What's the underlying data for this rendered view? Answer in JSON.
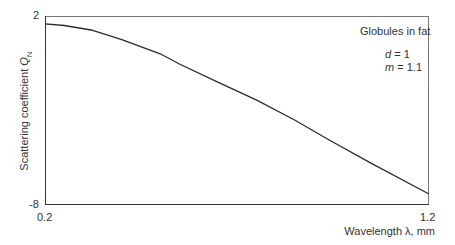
{
  "chart_data": {
    "type": "line",
    "title": "",
    "xlabel": "Wavelength λ, mm",
    "ylabel": "Scattering coefficient Q_N",
    "ylabel_main": "Scattering coefficient ",
    "ylabel_symbol": "Q",
    "ylabel_subscript": "N",
    "xlim": [
      0.2,
      1.2
    ],
    "ylim": [
      -8,
      2
    ],
    "x_ticks": [
      "0.2",
      "1.2"
    ],
    "y_ticks": [
      "2",
      "-8"
    ],
    "grid": false,
    "annotation": {
      "title": "Globules in fat",
      "params": [
        {
          "name": "d",
          "value": "= 1"
        },
        {
          "name": "m",
          "value": "= 1.1"
        }
      ]
    },
    "series": [
      {
        "name": "Globules in fat (d = 1, m = 1.1)",
        "x": [
          0.2,
          0.25,
          0.32,
          0.4,
          0.5,
          0.55,
          0.65,
          0.75,
          0.85,
          0.94,
          1.05,
          1.2
        ],
        "y": [
          1.58,
          1.5,
          1.26,
          0.75,
          0.0,
          -0.54,
          -1.5,
          -2.44,
          -3.5,
          -4.56,
          -5.8,
          -7.42
        ]
      }
    ]
  }
}
